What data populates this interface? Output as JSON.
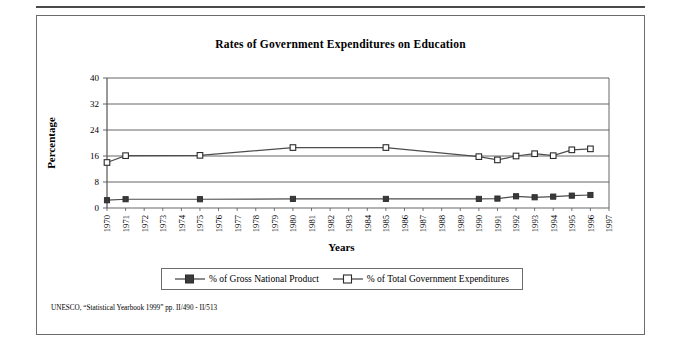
{
  "figure": {
    "title": "Rates of Government Expenditures on Education",
    "xlabel": "Years",
    "ylabel": "Percentage",
    "footnote": "UNESCO, “Statistical Yearbook 1999” pp. II/490 - II/513"
  },
  "colors": {
    "line": "#4d4d4d",
    "axis": "#555555",
    "grid": "#555555",
    "marker_fill_gnp": "#3a3a3a",
    "marker_fill_gov": "#ffffff",
    "frame": "#6b6b6b",
    "text": "#000000"
  },
  "legend": {
    "entries": [
      {
        "label": "% of Gross National Product",
        "marker": "filled-square",
        "icon": "legend-marker-gnp"
      },
      {
        "label": "% of Total Government Expenditures",
        "marker": "open-square",
        "icon": "legend-marker-gov"
      }
    ]
  },
  "chart_data": {
    "type": "line",
    "title": "Rates of Government Expenditures on Education",
    "xlabel": "Years",
    "ylabel": "Percentage",
    "xlim": [
      1970,
      1997
    ],
    "ylim": [
      0,
      40
    ],
    "yticks": [
      0,
      8,
      16,
      24,
      32,
      40
    ],
    "grid": "horizontal",
    "legend_position": "bottom",
    "categories": [
      "1970",
      "1971",
      "1972",
      "1973",
      "1974",
      "1975",
      "1976",
      "1977",
      "1978",
      "1979",
      "1980",
      "1981",
      "1982",
      "1983",
      "1984",
      "1985",
      "1986",
      "1987",
      "1988",
      "1989",
      "1990",
      "1991",
      "1992",
      "1993",
      "1994",
      "1995",
      "1996",
      "1997"
    ],
    "series": [
      {
        "name": "% of Gross National Product",
        "marker": "filled-square",
        "points": [
          {
            "x": 1970,
            "y": 2.4
          },
          {
            "x": 1971,
            "y": 2.7
          },
          {
            "x": 1975,
            "y": 2.7
          },
          {
            "x": 1980,
            "y": 2.8
          },
          {
            "x": 1985,
            "y": 2.8
          },
          {
            "x": 1990,
            "y": 2.8
          },
          {
            "x": 1991,
            "y": 2.9
          },
          {
            "x": 1992,
            "y": 3.6
          },
          {
            "x": 1993,
            "y": 3.3
          },
          {
            "x": 1994,
            "y": 3.5
          },
          {
            "x": 1995,
            "y": 3.8
          },
          {
            "x": 1996,
            "y": 4.0
          }
        ]
      },
      {
        "name": "% of Total Government Expenditures",
        "marker": "open-square",
        "points": [
          {
            "x": 1970,
            "y": 14.0
          },
          {
            "x": 1971,
            "y": 16.1
          },
          {
            "x": 1975,
            "y": 16.2
          },
          {
            "x": 1980,
            "y": 18.6
          },
          {
            "x": 1985,
            "y": 18.6
          },
          {
            "x": 1990,
            "y": 15.8
          },
          {
            "x": 1991,
            "y": 14.8
          },
          {
            "x": 1992,
            "y": 16.0
          },
          {
            "x": 1993,
            "y": 16.7
          },
          {
            "x": 1994,
            "y": 16.1
          },
          {
            "x": 1995,
            "y": 17.9
          },
          {
            "x": 1996,
            "y": 18.2
          }
        ]
      }
    ]
  }
}
